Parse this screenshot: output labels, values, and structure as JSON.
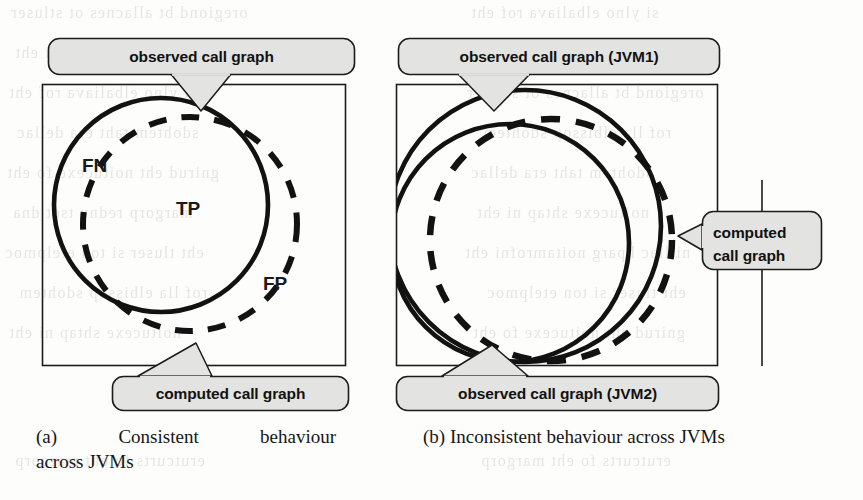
{
  "figure": {
    "panels": [
      {
        "id": "a",
        "caption_label": "(a)",
        "caption_word1": "Consistent",
        "caption_word2": "behaviour",
        "caption_line2": "across JVMs",
        "caption_full": "(a) Consistent behaviour across JVMs",
        "callouts": [
          {
            "name": "observed-call-graph",
            "text": "observed call graph"
          },
          {
            "name": "computed-call-graph",
            "text": "computed call graph"
          }
        ],
        "region_labels": [
          {
            "name": "false-negative",
            "text": "FN"
          },
          {
            "name": "true-positive",
            "text": "TP"
          },
          {
            "name": "false-positive",
            "text": "FP"
          }
        ],
        "shapes": [
          {
            "name": "observed-call-graph-circle",
            "style": "solid"
          },
          {
            "name": "computed-call-graph-circle",
            "style": "dashed"
          }
        ]
      },
      {
        "id": "b",
        "caption_label": "(b)",
        "caption_text": "Inconsistent behaviour across JVMs",
        "caption_full": "(b) Inconsistent behaviour across JVMs",
        "callouts": [
          {
            "name": "observed-call-graph-jvm1",
            "text": "observed call graph (JVM1)"
          },
          {
            "name": "computed-call-graph",
            "text_line1": "computed",
            "text_line2": "call graph"
          },
          {
            "name": "observed-call-graph-jvm2",
            "text": "observed call graph (JVM2)"
          }
        ],
        "region_labels": [],
        "shapes": [
          {
            "name": "observed-call-graph-jvm1-circle",
            "style": "solid"
          },
          {
            "name": "observed-call-graph-jvm2-circle",
            "style": "solid"
          },
          {
            "name": "computed-call-graph-circle",
            "style": "dashed"
          }
        ]
      }
    ]
  },
  "colors": {
    "stroke": "#121212",
    "callout_fill": "#e3e3e1",
    "frame_stroke": "#1c1c1c",
    "page_background": "#fdfdfc"
  },
  "bleed_through_lines": [
    "oregiond bt allacnes ot stluser",
    "ni llac hparg noitamrofni eht",
    "si ylno elbaliava rof eht",
    "sdohtem taht era dellac",
    "gnirud eht noitucexe fo eht",
    "margorp rednu tset dna",
    "eht tluser si ton etelpmoc",
    "rof lla elbissop sdohtem",
    "noitucexe shtap ni eht",
    "erutcurts fo eht margorp"
  ]
}
